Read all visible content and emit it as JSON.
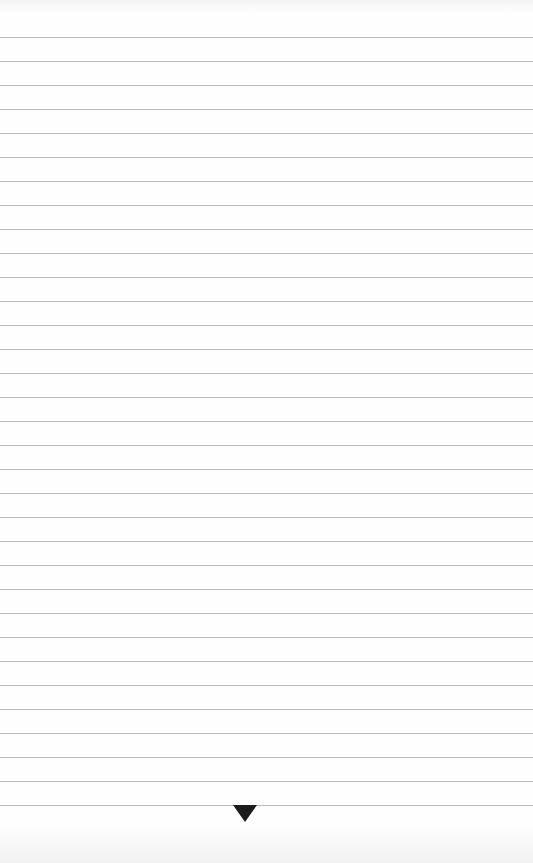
{
  "page": {
    "type": "ruled-paper",
    "background_color": "#fefefe",
    "rule_color": "#b9b9b9",
    "first_rule_y": 37,
    "rule_spacing": 24,
    "rule_count": 33
  },
  "ornament": {
    "shape": "inverted-triangle",
    "color": "#1c1c1c",
    "center_x": 245,
    "top_y": 805
  }
}
